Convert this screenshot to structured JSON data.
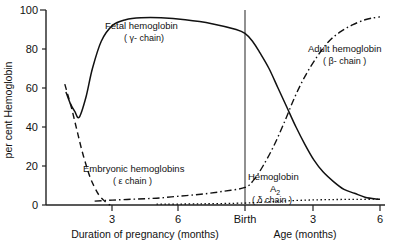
{
  "chart_data": {
    "type": "line",
    "title": "",
    "xlabel_left": "Duration of pregnancy (months)",
    "xlabel_right": "Age (months)",
    "ylabel": "per cent Hemoglobin",
    "ylim": [
      0,
      100
    ],
    "yticks": [
      0,
      20,
      40,
      60,
      80,
      100
    ],
    "ytick_labels": [
      "0",
      "20",
      "40",
      "60",
      "80",
      "100"
    ],
    "xticks_left": [
      3,
      6
    ],
    "xtick_labels_left": [
      "3",
      "6"
    ],
    "xticks_right": [
      3,
      6
    ],
    "xtick_labels_right": [
      "3",
      "6"
    ],
    "birth_marker_label": "Birth",
    "grid": false,
    "legend_position": "inline-annotations",
    "series": [
      {
        "name": "Fetal hemoglobin",
        "chain": "( γ- chain)",
        "style": "solid",
        "label_line1": "Fetal hemoglobin",
        "label_line2": "( γ- chain)",
        "x": [
          0.9,
          1.1,
          1.3,
          1.5,
          1.8,
          2.1,
          2.5,
          3.0,
          3.6,
          4.3,
          5.2,
          6.3,
          7.5,
          8.6,
          9.0,
          9.5,
          10.0,
          10.6,
          11.2,
          11.8,
          12.4,
          13.0,
          13.6,
          14.2,
          14.9,
          15.6,
          16.3,
          17.0,
          17.8,
          18.0
        ],
        "y": [
          58,
          52,
          48,
          45,
          55,
          70,
          84,
          92,
          95,
          96,
          96,
          95,
          93,
          90,
          88,
          84,
          78,
          70,
          60,
          50,
          40,
          31,
          23,
          17,
          12,
          8,
          6,
          4,
          3,
          3
        ]
      },
      {
        "name": "Embryonic hemoglobins",
        "chain": "( ε chain )",
        "style": "dashed",
        "label_line1": "Embryonic hemoglobins",
        "label_line2": "( ε chain )",
        "x": [
          0.85,
          1.0,
          1.15,
          1.3,
          1.45,
          1.6,
          1.8,
          2.0,
          2.2,
          2.4,
          2.6,
          2.75,
          2.9
        ],
        "y": [
          62,
          56,
          50,
          43,
          36,
          29,
          21,
          14,
          9,
          5,
          2.5,
          1,
          0
        ]
      },
      {
        "name": "Adult hemoglobin",
        "chain": "( β- chain )",
        "style": "dash-dot",
        "label_line1": "Adult hemoglobin",
        "label_line2": "( β- chain )",
        "x": [
          2.2,
          3.0,
          4.0,
          5.0,
          6.0,
          7.0,
          8.0,
          9.0,
          9.6,
          10.2,
          10.9,
          11.6,
          12.3,
          13.0,
          13.8,
          14.6,
          15.4,
          16.2,
          17.0,
          17.6,
          18.0
        ],
        "y": [
          2,
          2.5,
          3,
          3.5,
          4.5,
          5.5,
          7,
          9,
          13,
          20,
          30,
          42,
          55,
          66,
          76,
          84,
          89,
          92.5,
          95,
          96,
          96.5
        ]
      },
      {
        "name": "Hemoglobin A2",
        "chain": "( δ chain )",
        "style": "dotted",
        "label_line1": "Hemoglobin",
        "label_line2": "A",
        "label_sub": "2",
        "label_line3": "( δ  chain )",
        "x": [
          5.0,
          7.0,
          9.0,
          10.5,
          12.0,
          13.5,
          15.0,
          16.5,
          18.0
        ],
        "y": [
          0.4,
          0.6,
          1.0,
          1.6,
          2.2,
          2.6,
          2.8,
          2.9,
          3.0
        ]
      }
    ]
  },
  "colors": {
    "ink": "#111111",
    "axis": "#222222",
    "birth_line": "#555555",
    "background": "#ffffff"
  }
}
